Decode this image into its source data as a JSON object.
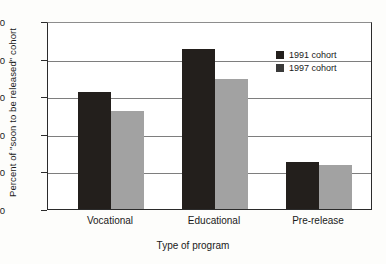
{
  "chart_data": {
    "type": "bar",
    "title": "",
    "xlabel": "Type of program",
    "ylabel": "Percent of \"soon to be released\" cohort",
    "categories": [
      "Vocational",
      "Educational",
      "Pre-release"
    ],
    "series": [
      {
        "name": "1991 cohort",
        "color": "#231f1c",
        "values": [
          31.0,
          42.5,
          12.5
        ]
      },
      {
        "name": "1997 cohort",
        "color": "#a2a2a2",
        "values": [
          26.2,
          34.6,
          11.8
        ]
      }
    ],
    "ylim": [
      0,
      50
    ],
    "yticks": [
      0,
      10,
      20,
      30,
      40,
      50
    ],
    "ytick_labels": [
      "0",
      "10",
      "20",
      "30",
      "40",
      "50"
    ],
    "grid": true,
    "legend_position": "top-right",
    "legend": [
      {
        "label": "1991 cohort",
        "swatch": "#231f1c"
      },
      {
        "label": "1997 cohort",
        "swatch": "#3a3a3a"
      }
    ]
  }
}
